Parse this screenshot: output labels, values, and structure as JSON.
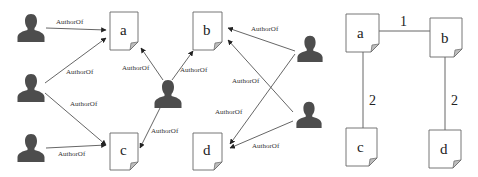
{
  "diagram": {
    "left_graph": {
      "description": "Bipartite authorship graph: authors linked to documents via AuthorOf edges",
      "authors": [
        {
          "id": "p1",
          "x": 31,
          "y": 27
        },
        {
          "id": "p2",
          "x": 31,
          "y": 87
        },
        {
          "id": "p3",
          "x": 31,
          "y": 147
        },
        {
          "id": "p4",
          "x": 168,
          "y": 93
        },
        {
          "id": "p5",
          "x": 310,
          "y": 49
        },
        {
          "id": "p6",
          "x": 309,
          "y": 114
        }
      ],
      "documents": [
        {
          "id": "a",
          "label": "a",
          "x": 110,
          "y": 12
        },
        {
          "id": "b",
          "label": "b",
          "x": 193,
          "y": 12
        },
        {
          "id": "c",
          "label": "c",
          "x": 110,
          "y": 133
        },
        {
          "id": "d",
          "label": "d",
          "x": 193,
          "y": 133
        }
      ],
      "edges": [
        {
          "from": "p1",
          "to": "a",
          "label": "AuthorOf"
        },
        {
          "from": "p2",
          "to": "a",
          "label": "AuthorOf"
        },
        {
          "from": "p2",
          "to": "c",
          "label": "AuthorOf"
        },
        {
          "from": "p3",
          "to": "c",
          "label": "AuthorOf"
        },
        {
          "from": "p4",
          "to": "a",
          "label": "AuthorOf"
        },
        {
          "from": "p4",
          "to": "b",
          "label": "AuthorOf"
        },
        {
          "from": "p4",
          "to": "c",
          "label": "AuthorOf"
        },
        {
          "from": "p5",
          "to": "b",
          "label": "AuthorOf"
        },
        {
          "from": "p5",
          "to": "d",
          "label": "AuthorOf"
        },
        {
          "from": "p6",
          "to": "b",
          "label": "AuthorOf"
        },
        {
          "from": "p6",
          "to": "d",
          "label": "AuthorOf"
        }
      ],
      "edge_label_text": "AuthorOf"
    },
    "right_graph": {
      "description": "Weighted document co-authorship graph",
      "documents": [
        {
          "id": "a",
          "label": "a",
          "x": 346,
          "y": 14
        },
        {
          "id": "b",
          "label": "b",
          "x": 430,
          "y": 18
        },
        {
          "id": "c",
          "label": "c",
          "x": 346,
          "y": 128
        },
        {
          "id": "d",
          "label": "d",
          "x": 429,
          "y": 130
        }
      ],
      "edges": [
        {
          "from": "a",
          "to": "b",
          "weight": "1"
        },
        {
          "from": "a",
          "to": "c",
          "weight": "2"
        },
        {
          "from": "b",
          "to": "d",
          "weight": "2"
        }
      ]
    }
  }
}
